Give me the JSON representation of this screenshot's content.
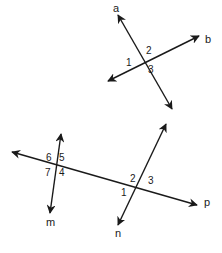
{
  "diagram": {
    "title": "",
    "figure_top": {
      "lines": [
        {
          "name": "a",
          "x1": 118,
          "y1": 15,
          "x2": 172,
          "y2": 109,
          "label": "a",
          "label_x": 113,
          "label_y": 12
        },
        {
          "name": "b",
          "x1": 108,
          "y1": 81,
          "x2": 199,
          "y2": 36,
          "label": "b",
          "label_x": 205,
          "label_y": 43
        }
      ],
      "angles": [
        {
          "id": "1",
          "x": 126,
          "y": 66
        },
        {
          "id": "2",
          "x": 146,
          "y": 54
        },
        {
          "id": "3",
          "x": 148,
          "y": 73
        }
      ]
    },
    "figure_bottom": {
      "lines": [
        {
          "name": "p",
          "x1": 12,
          "y1": 152,
          "x2": 197,
          "y2": 205,
          "label": "p",
          "label_x": 204,
          "label_y": 206
        },
        {
          "name": "m",
          "x1": 61,
          "y1": 134,
          "x2": 50,
          "y2": 213,
          "label": "m",
          "label_x": 46,
          "label_y": 226
        },
        {
          "name": "n",
          "x1": 166,
          "y1": 124,
          "x2": 118,
          "y2": 225,
          "label": "n",
          "label_x": 115,
          "label_y": 237
        }
      ],
      "angles": [
        {
          "id": "6",
          "x": 46,
          "y": 161
        },
        {
          "id": "5",
          "x": 59,
          "y": 161
        },
        {
          "id": "7",
          "x": 45,
          "y": 176
        },
        {
          "id": "4",
          "x": 59,
          "y": 176
        },
        {
          "id": "2",
          "x": 130,
          "y": 182
        },
        {
          "id": "3",
          "x": 148,
          "y": 184
        },
        {
          "id": "1",
          "x": 121,
          "y": 196
        }
      ]
    }
  }
}
